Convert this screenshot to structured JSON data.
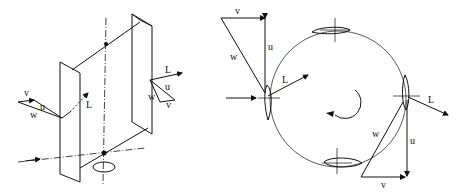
{
  "figure": {
    "left_panel": {
      "description": "isometric view of straight-bladed vertical axis turbine",
      "labels": {
        "left_blade": {
          "v": "v",
          "u": "u",
          "w": "w",
          "L": "L"
        },
        "right_blade": {
          "L": "L",
          "u": "u",
          "w": "w",
          "v": "v"
        }
      }
    },
    "right_panel": {
      "description": "top view of rotor circle with four airfoils and velocity triangles",
      "labels": {
        "left_triangle": {
          "v": "v",
          "u": "u",
          "w": "w",
          "L": "L"
        },
        "right_triangle": {
          "L": "L",
          "w": "w",
          "u": "u",
          "v": "v"
        }
      }
    },
    "colors": {
      "ink": "#111111",
      "background": "#ffffff"
    }
  }
}
